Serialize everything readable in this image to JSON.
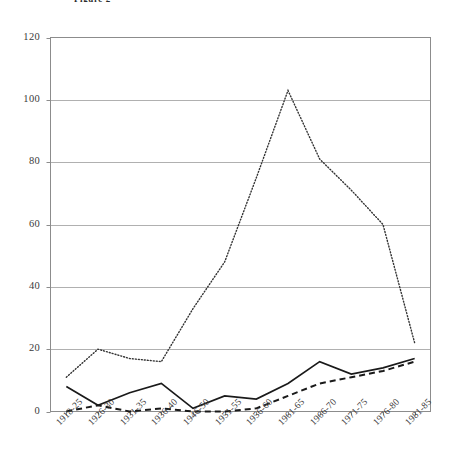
{
  "figure": {
    "title": "Figure 2",
    "title_visible_fragment": "Figure 2"
  },
  "chart_data": {
    "type": "line",
    "title": "Figure 2",
    "xlabel": "",
    "ylabel": "",
    "ylim": [
      0,
      120
    ],
    "yticks": [
      0,
      20,
      40,
      60,
      80,
      100,
      120
    ],
    "grid": true,
    "grid_axis": "y",
    "legend": "none",
    "legend_position": "none",
    "categories": [
      "1918-25",
      "1926-30",
      "1931-35",
      "1936-40",
      "1946-50",
      "1951-55",
      "1956-60",
      "1961-65",
      "1966-70",
      "1971-75",
      "1976-80",
      "1981-85"
    ],
    "series": [
      {
        "name": "series-dotted",
        "style": "dotted",
        "color": "#333333",
        "values": [
          11,
          20,
          17,
          16,
          33,
          48,
          75,
          103,
          81,
          71,
          60,
          22
        ]
      },
      {
        "name": "series-solid",
        "style": "solid",
        "color": "#1a1a1a",
        "values": [
          8,
          2,
          6,
          9,
          1,
          5,
          4,
          9,
          16,
          12,
          14,
          17
        ]
      },
      {
        "name": "series-dashed",
        "style": "dashed",
        "color": "#1a1a1a",
        "values": [
          0,
          2,
          0,
          1,
          0,
          0,
          1,
          5,
          9,
          11,
          13,
          16
        ]
      }
    ]
  }
}
